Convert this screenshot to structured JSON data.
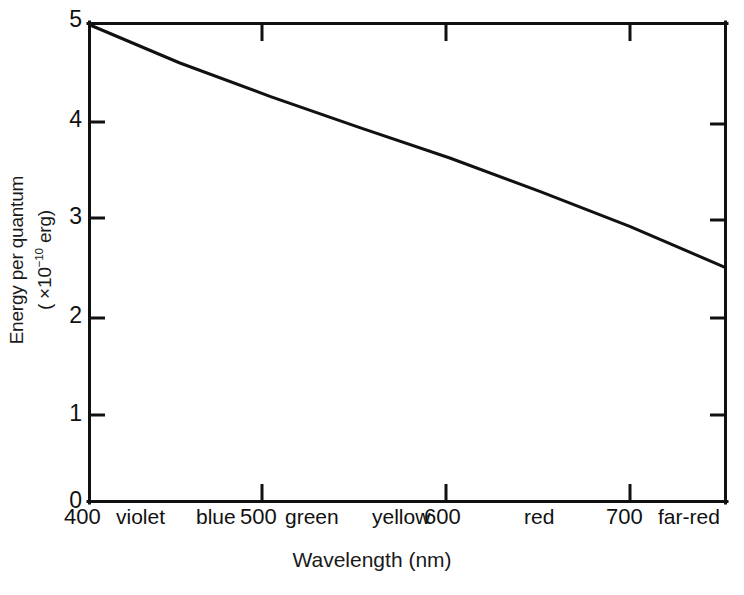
{
  "chart_data": {
    "type": "line",
    "title": "",
    "xlabel": "Wavelength (nm)",
    "ylabel_line1": "Energy per quantum",
    "ylabel_line2": "( ×10",
    "ylabel_exp": "−10",
    "ylabel_line2_end": " erg)",
    "ylabel_full": "Energy per quantum ( ×10⁻¹⁰ erg)",
    "xlim": [
      400,
      753
    ],
    "ylim": [
      0,
      5
    ],
    "xticks": [
      400,
      500,
      600,
      700
    ],
    "xtick_labels": [
      "400",
      "500",
      "600",
      "700"
    ],
    "yticks": [
      0,
      1,
      2,
      3,
      4,
      5
    ],
    "ytick_labels": [
      "0",
      "1",
      "2",
      "3",
      "4",
      "5"
    ],
    "grid": false,
    "legend": "none",
    "ticks_on_all_sides": true,
    "color_bands": [
      {
        "name": "violet",
        "center_nm": 432
      },
      {
        "name": "blue",
        "center_nm": 482
      },
      {
        "name": "green",
        "center_nm": 524
      },
      {
        "name": "yellow",
        "center_nm": 577
      },
      {
        "name": "red",
        "center_nm": 648
      },
      {
        "name": "far-red",
        "center_nm": 730
      }
    ],
    "series": [
      {
        "name": "Energy per quantum",
        "color": "#111111",
        "x": [
          400,
          450,
          500,
          550,
          600,
          650,
          700,
          753
        ],
        "values": [
          5.0,
          4.6,
          4.25,
          3.92,
          3.6,
          3.25,
          2.88,
          2.45
        ]
      }
    ],
    "annotations": []
  },
  "axes": {
    "x_title": "Wavelength (nm)",
    "y_title_line1": "Energy per quantum",
    "y_title_line2_pre": "( ×10",
    "y_title_line2_sup": "−10",
    "y_title_line2_post": " erg)"
  },
  "style": {
    "background": "#ffffff",
    "ink": "#111111",
    "axis_width_px": 3,
    "line_width_px": 3
  }
}
